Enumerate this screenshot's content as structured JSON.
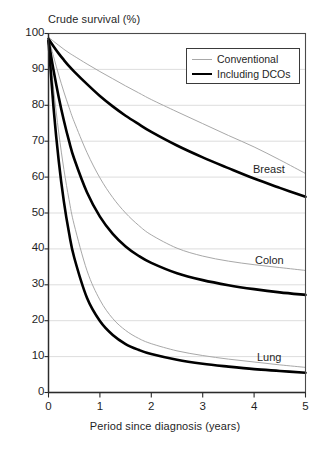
{
  "chart_data": {
    "type": "line",
    "title": "",
    "ylabel": "Crude survival (%)",
    "xlabel": "Period since diagnosis (years)",
    "xlim": [
      0,
      5
    ],
    "ylim": [
      0,
      100
    ],
    "xticks": [
      "0",
      "1",
      "2",
      "3",
      "4",
      "5"
    ],
    "yticks": [
      "0",
      "10",
      "20",
      "30",
      "40",
      "50",
      "60",
      "70",
      "80",
      "90",
      "100"
    ],
    "grid": "horizontal",
    "legend_position": "upper-right",
    "legend": [
      {
        "label": "Conventional",
        "style": "thin",
        "color": "#a8a8a8"
      },
      {
        "label": "Including DCOs",
        "style": "thick",
        "color": "#000000"
      }
    ],
    "annotations": [
      {
        "text": "Breast",
        "x": 4.2,
        "y": 68
      },
      {
        "text": "Colon",
        "x": 4.2,
        "y": 40
      },
      {
        "text": "Lung",
        "x": 4.2,
        "y": 13
      }
    ],
    "x": [
      0,
      0.1,
      0.2,
      0.3,
      0.4,
      0.5,
      0.75,
      1,
      1.25,
      1.5,
      1.75,
      2,
      2.5,
      3,
      3.5,
      4,
      4.5,
      5
    ],
    "series": [
      {
        "name": "Breast - Conventional",
        "group": "Breast",
        "method": "Conventional",
        "color": "#a8a8a8",
        "width": 1,
        "values": [
          99.0,
          97.8,
          96.7,
          95.6,
          94.6,
          93.7,
          91.5,
          89.4,
          87.4,
          85.4,
          83.5,
          81.6,
          78.2,
          74.9,
          71.6,
          68.4,
          64.8,
          61.0
        ]
      },
      {
        "name": "Breast - Including DCOs",
        "group": "Breast",
        "method": "Including DCOs",
        "color": "#000000",
        "width": 2.6,
        "values": [
          98.5,
          96.4,
          94.4,
          92.6,
          90.9,
          89.4,
          85.9,
          82.6,
          79.7,
          77.1,
          74.8,
          72.6,
          68.8,
          65.5,
          62.5,
          59.6,
          57.0,
          54.5
        ]
      },
      {
        "name": "Colon - Conventional",
        "group": "Colon",
        "method": "Conventional",
        "color": "#a8a8a8",
        "width": 1,
        "values": [
          99.0,
          93.5,
          88.4,
          83.7,
          79.4,
          75.4,
          66.8,
          59.8,
          54.3,
          50.0,
          46.6,
          43.9,
          40.2,
          38.0,
          36.6,
          35.6,
          34.8,
          34.0
        ]
      },
      {
        "name": "Colon - Including DCOs",
        "group": "Colon",
        "method": "Including DCOs",
        "color": "#000000",
        "width": 2.6,
        "values": [
          98.0,
          89.6,
          82.2,
          75.7,
          70.0,
          65.1,
          55.7,
          49.0,
          44.2,
          40.7,
          38.1,
          36.1,
          33.2,
          31.3,
          29.9,
          28.8,
          27.9,
          27.2
        ]
      },
      {
        "name": "Lung - Conventional",
        "group": "Lung",
        "method": "Conventional",
        "color": "#a8a8a8",
        "width": 1,
        "values": [
          99.0,
          84.5,
          72.3,
          62.1,
          53.7,
          46.7,
          33.9,
          25.8,
          20.6,
          17.3,
          15.1,
          13.6,
          11.6,
          10.3,
          9.3,
          8.5,
          7.7,
          7.0
        ]
      },
      {
        "name": "Lung - Including DCOs",
        "group": "Lung",
        "method": "Including DCOs",
        "color": "#000000",
        "width": 2.6,
        "values": [
          98.0,
          79.0,
          64.4,
          53.1,
          44.4,
          37.6,
          26.3,
          19.9,
          16.0,
          13.5,
          11.9,
          10.7,
          9.1,
          8.0,
          7.2,
          6.5,
          6.0,
          5.5
        ]
      }
    ]
  },
  "axes": {
    "ylabel": "Crude survival (%)",
    "xlabel": "Period since diagnosis (years)",
    "ytick_labels": [
      "100",
      "90",
      "80",
      "70",
      "60",
      "50",
      "40",
      "30",
      "20",
      "10",
      "0"
    ],
    "xtick_labels": [
      "0",
      "1",
      "2",
      "3",
      "4",
      "5"
    ]
  },
  "legend": {
    "items": [
      {
        "label": "Conventional"
      },
      {
        "label": "Including DCOs"
      }
    ]
  },
  "annotations": {
    "breast": "Breast",
    "colon": "Colon",
    "lung": "Lung"
  },
  "colors": {
    "conventional": "#a8a8a8",
    "including_dcos": "#000000",
    "grid": "#d9d9d9",
    "axis": "#4a4a4a",
    "text": "#1f1f1f"
  }
}
